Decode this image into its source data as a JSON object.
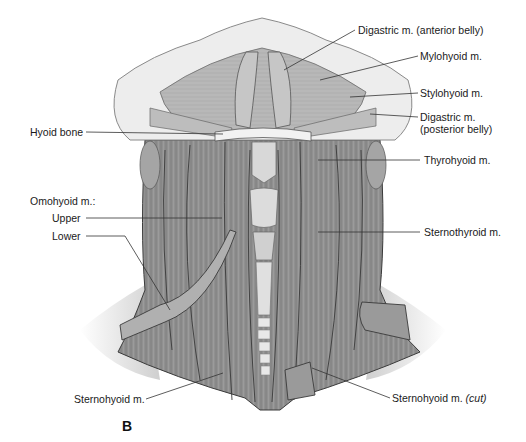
{
  "figure": {
    "panel_letter": "B"
  },
  "labels": {
    "digastric_anterior": "Digastric m. (anterior belly)",
    "mylohyoid": "Mylohyoid m.",
    "stylohyoid": "Stylohyoid m.",
    "digastric_posterior_line1": "Digastric m.",
    "digastric_posterior_line2": "(posterior belly)",
    "hyoid_bone": "Hyoid bone",
    "thyrohyoid": "Thyrohyoid m.",
    "omohyoid_heading": "Omohyoid m.:",
    "omohyoid_upper": "Upper",
    "omohyoid_lower": "Lower",
    "sternothyroid": "Sternothyroid m.",
    "sternohyoid": "Sternohyoid m.",
    "sternohyoid_cut_main": "Sternohyoid m.",
    "sternohyoid_cut_note": "(cut)"
  },
  "colors": {
    "muscle": "#8f8f8f",
    "muscle_dark": "#6f6f6f",
    "muscle_light": "#b3b3b3",
    "bone": "#e6e6e6",
    "skin": "#f0f0f0",
    "outline": "#3a3a3a",
    "leader": "#333333"
  }
}
